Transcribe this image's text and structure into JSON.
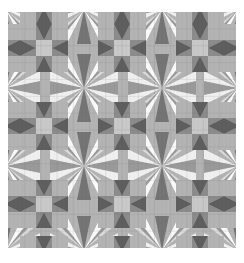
{
  "figure": {
    "title": "Grayscale patchwork quilt pattern",
    "kind": "repeating-geometric-tiling",
    "background_color": "#ffffff",
    "x": 8,
    "y": 12,
    "width": 228,
    "height": 236
  },
  "chart_data": {
    "type": "heatmap",
    "title": "Grayscale patchwork quilt pattern",
    "xlabel": "",
    "ylabel": "",
    "grid": true,
    "legend_position": "none",
    "unit_cell_px": 16.3,
    "grid_cells": {
      "cols": 14,
      "rows": 14
    },
    "block_size_cells": 3,
    "palette": {
      "darkest": "#5f5f5f",
      "dark": "#757575",
      "mid": "#9a9a9a",
      "mid_light": "#b4b4b4",
      "light": "#c9c9c9",
      "lighter": "#dcdcdc",
      "lightest": "#f0f0f0",
      "white": "#fafafa",
      "seam": "#aeaeae"
    },
    "categories": [
      "darkest",
      "dark",
      "mid",
      "mid_light",
      "light",
      "lighter",
      "lightest",
      "white"
    ],
    "values": [
      6,
      12,
      24,
      18,
      16,
      12,
      8,
      4
    ],
    "blocks": [
      {
        "name": "sawtooth-star",
        "count": 9,
        "center_fill": "#c9c9c9",
        "point_fill": "#5f5f5f",
        "ground_fill": "#9a9a9a",
        "corner_fill": "#b4b4b4"
      },
      {
        "name": "kaleidoscope",
        "count": 4,
        "wedge_fills": [
          "#9a9a9a",
          "#f0f0f0",
          "#b4b4b4",
          "#dcdcdc",
          "#757575",
          "#fafafa"
        ]
      }
    ],
    "star_centers": [
      [
        36,
        36
      ],
      [
        114,
        36
      ],
      [
        192,
        36
      ],
      [
        36,
        118
      ],
      [
        114,
        118
      ],
      [
        192,
        118
      ],
      [
        36,
        200
      ],
      [
        114,
        200
      ],
      [
        192,
        200
      ]
    ],
    "kaleidoscope_centers": [
      [
        0,
        77
      ],
      [
        77,
        0
      ],
      [
        77,
        77
      ],
      [
        77,
        155
      ],
      [
        155,
        77
      ],
      [
        155,
        155
      ],
      [
        0,
        155
      ],
      [
        228,
        77
      ],
      [
        228,
        155
      ]
    ],
    "ylim": [
      0,
      236
    ],
    "xlim": [
      0,
      228
    ]
  }
}
